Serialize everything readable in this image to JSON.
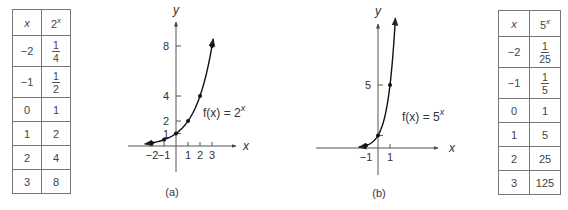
{
  "tables": [
    {
      "headers": {
        "x": "x",
        "base": "2",
        "exp": "x"
      },
      "rows": [
        {
          "x": "−2",
          "value": {
            "num": "1",
            "den": "4"
          }
        },
        {
          "x": "−1",
          "value": {
            "num": "1",
            "den": "2"
          }
        },
        {
          "x": "0",
          "value": "1"
        },
        {
          "x": "1",
          "value": "2"
        },
        {
          "x": "2",
          "value": "4"
        },
        {
          "x": "3",
          "value": "8"
        }
      ]
    },
    {
      "headers": {
        "x": "x",
        "base": "5",
        "exp": "x"
      },
      "rows": [
        {
          "x": "−2",
          "value": {
            "num": "1",
            "den": "25"
          }
        },
        {
          "x": "−1",
          "value": {
            "num": "1",
            "den": "5"
          }
        },
        {
          "x": "0",
          "value": "1"
        },
        {
          "x": "1",
          "value": "5"
        },
        {
          "x": "2",
          "value": "25"
        },
        {
          "x": "3",
          "value": "125"
        }
      ]
    }
  ],
  "chart_data": [
    {
      "type": "line",
      "caption": "(a)",
      "function_label": {
        "prefix": "f(x) = 2",
        "exp": "x"
      },
      "base": 2,
      "xlabel": "x",
      "ylabel": "y",
      "x": [
        -2,
        -1,
        0,
        1,
        2,
        3
      ],
      "y": [
        0.25,
        0.5,
        1,
        2,
        4,
        8
      ],
      "xticks": [
        {
          "v": -2,
          "label": "−2"
        },
        {
          "v": -1,
          "label": "−1"
        },
        {
          "v": 1,
          "label": "1"
        },
        {
          "v": 2,
          "label": "2"
        },
        {
          "v": 3,
          "label": "3"
        }
      ],
      "yticks": [
        {
          "v": 1,
          "label": "1"
        },
        {
          "v": 2,
          "label": "2"
        },
        {
          "v": 4,
          "label": "4"
        },
        {
          "v": 8,
          "label": "8"
        }
      ],
      "curve_domain": [
        -2.6,
        3.1
      ],
      "xlim": [
        -3,
        5
      ],
      "ylim": [
        -2.5,
        9.8
      ],
      "grid": false
    },
    {
      "type": "line",
      "caption": "(b)",
      "function_label": {
        "prefix": "f(x) = 5",
        "exp": "x"
      },
      "base": 5,
      "xlabel": "x",
      "ylabel": "y",
      "x": [
        -1,
        0,
        1
      ],
      "y": [
        0.2,
        1,
        5
      ],
      "xticks": [
        {
          "v": -1,
          "label": "−1"
        },
        {
          "v": 1,
          "label": "1"
        }
      ],
      "yticks": [
        {
          "v": 1,
          "label": ""
        },
        {
          "v": 5,
          "label": "5"
        }
      ],
      "curve_domain": [
        -1.6,
        1.45
      ],
      "xlim": [
        -5,
        5
      ],
      "ylim": [
        -2.2,
        9.8
      ],
      "grid": false
    }
  ]
}
